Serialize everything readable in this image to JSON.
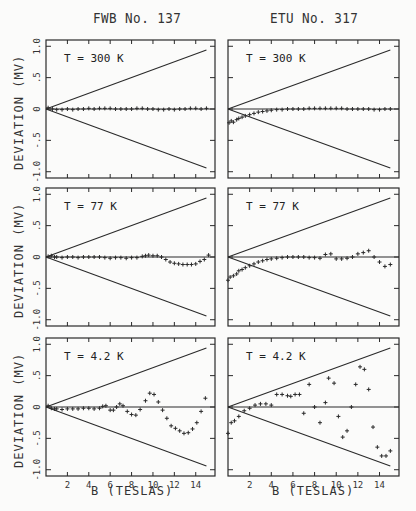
{
  "columns": [
    {
      "title": "FWB No. 137"
    },
    {
      "title": "ETU No. 317"
    }
  ],
  "ylabel": "DEVIATION (MV)",
  "xlabel": "B (TESLAS)",
  "ticks": {
    "y": [
      "1.0",
      ".5",
      "0",
      "-.5",
      "-1.0"
    ],
    "y_values": [
      1.0,
      0.5,
      0,
      -0.5,
      -1.0
    ],
    "x": [
      "2",
      "4",
      "6",
      "8",
      "10",
      "12",
      "14"
    ],
    "x_values": [
      2,
      4,
      6,
      8,
      10,
      12,
      14
    ]
  },
  "panels": [
    {
      "label": "T = 300 K"
    },
    {
      "label": "T = 300 K"
    },
    {
      "label": "T =  77 K"
    },
    {
      "label": "T =  77 K"
    },
    {
      "label": "T = 4.2 K"
    },
    {
      "label": "T = 4.2 K"
    }
  ],
  "chart_data": [
    {
      "type": "scatter",
      "title": "FWB No. 137, T = 300 K",
      "xlabel": "B (TESLAS)",
      "ylabel": "DEVIATION (MV)",
      "xlim": [
        0,
        15.8
      ],
      "ylim": [
        -1.1,
        1.1
      ],
      "envelope": {
        "slope_mv_per_T": 0.0627,
        "x_end": 15
      },
      "x": [
        0.2,
        0.6,
        1,
        1.5,
        2,
        2.5,
        3,
        3.5,
        4,
        4.5,
        5,
        5.5,
        6,
        6.5,
        7,
        7.5,
        8,
        8.5,
        9,
        9.5,
        10,
        10.5,
        11,
        11.5,
        12,
        12.5,
        13,
        13.5,
        14,
        14.5,
        15
      ],
      "y": [
        0.02,
        0.0,
        -0.01,
        -0.01,
        0.0,
        -0.01,
        0.0,
        0.0,
        0.01,
        0.0,
        0.01,
        0.01,
        0.01,
        0.0,
        0.0,
        0.0,
        0.0,
        0.01,
        0.01,
        0.0,
        0.0,
        -0.01,
        -0.01,
        0.0,
        -0.01,
        0.0,
        0.0,
        0.01,
        0.01,
        0.0,
        0.01
      ]
    },
    {
      "type": "scatter",
      "title": "ETU No. 317, T = 300 K",
      "xlabel": "B (TESLAS)",
      "ylabel": "DEVIATION (MV)",
      "xlim": [
        0,
        15.8
      ],
      "ylim": [
        -1.1,
        1.1
      ],
      "envelope": {
        "slope_mv_per_T": 0.0627,
        "x_end": 15
      },
      "x": [
        0.1,
        0.3,
        0.5,
        0.8,
        1,
        1.3,
        1.6,
        2,
        2.4,
        2.8,
        3.2,
        3.6,
        4,
        4.5,
        5,
        5.5,
        6,
        6.5,
        7,
        7.5,
        8,
        8.5,
        9,
        9.5,
        10,
        10.5,
        11,
        11.5,
        12,
        12.5,
        13,
        13.5,
        14,
        14.5,
        15
      ],
      "y": [
        -0.22,
        -0.19,
        -0.21,
        -0.17,
        -0.15,
        -0.13,
        -0.11,
        -0.09,
        -0.07,
        -0.05,
        -0.04,
        -0.03,
        -0.02,
        -0.01,
        -0.01,
        0.0,
        0.0,
        0.0,
        0.0,
        0.01,
        0.01,
        0.01,
        0.01,
        0.01,
        0.01,
        0.01,
        0.0,
        0.0,
        0.0,
        0.0,
        0.0,
        -0.01,
        -0.01,
        0.0,
        0.0
      ]
    },
    {
      "type": "scatter",
      "title": "FWB No. 137, T = 77 K",
      "xlabel": "B (TESLAS)",
      "ylabel": "DEVIATION (MV)",
      "xlim": [
        0,
        15.8
      ],
      "ylim": [
        -1.1,
        1.1
      ],
      "envelope": {
        "slope_mv_per_T": 0.0627,
        "x_end": 15
      },
      "x": [
        0.2,
        0.5,
        0.8,
        1,
        1.5,
        2,
        2.5,
        3,
        3.5,
        4,
        4.5,
        5,
        5.5,
        6,
        6.5,
        7,
        7.5,
        8,
        8.5,
        9,
        9.3,
        9.6,
        10,
        10.4,
        10.8,
        11.2,
        11.6,
        12,
        12.4,
        12.8,
        13.2,
        13.6,
        14,
        14.4,
        14.8,
        15.2
      ],
      "y": [
        0.01,
        0.02,
        0.0,
        0.0,
        -0.01,
        0.0,
        0.0,
        -0.01,
        0.0,
        0.0,
        0.0,
        0.0,
        -0.01,
        -0.02,
        -0.01,
        -0.01,
        -0.02,
        -0.01,
        -0.01,
        0.01,
        0.02,
        0.03,
        0.02,
        0.02,
        0.0,
        -0.04,
        -0.08,
        -0.1,
        -0.11,
        -0.12,
        -0.12,
        -0.12,
        -0.11,
        -0.07,
        -0.04,
        0.03,
        0.09,
        0.15
      ]
    },
    {
      "type": "scatter",
      "title": "ETU No. 317, T = 77 K",
      "xlabel": "B (TESLAS)",
      "ylabel": "DEVIATION (MV)",
      "xlim": [
        0,
        15.8
      ],
      "ylim": [
        -1.1,
        1.1
      ],
      "envelope": {
        "slope_mv_per_T": 0.0627,
        "x_end": 15
      },
      "x": [
        0.0,
        0.2,
        0.5,
        0.8,
        1,
        1.3,
        1.6,
        2,
        2.4,
        2.8,
        3.2,
        3.6,
        4,
        4.5,
        5,
        5.5,
        6,
        6.5,
        7,
        7.5,
        8,
        8.5,
        9,
        9.5,
        10,
        10.5,
        11,
        11.5,
        12,
        12.5,
        13,
        13.5,
        14,
        14.5,
        15
      ],
      "y": [
        -0.37,
        -0.32,
        -0.3,
        -0.27,
        -0.22,
        -0.2,
        -0.17,
        -0.14,
        -0.11,
        -0.08,
        -0.06,
        -0.04,
        -0.03,
        -0.02,
        -0.01,
        0.0,
        0.0,
        0.0,
        0.0,
        -0.01,
        -0.01,
        -0.02,
        0.04,
        0.05,
        -0.03,
        -0.03,
        -0.02,
        0.0,
        0.05,
        0.07,
        0.1,
        0.0,
        -0.08,
        -0.15,
        -0.12
      ]
    },
    {
      "type": "scatter",
      "title": "FWB No. 137, T = 4.2 K",
      "xlabel": "B (TESLAS)",
      "ylabel": "DEVIATION (MV)",
      "xlim": [
        0,
        15.8
      ],
      "ylim": [
        -1.1,
        1.1
      ],
      "envelope": {
        "slope_mv_per_T": 0.0627,
        "x_end": 15
      },
      "x": [
        0.2,
        0.5,
        0.8,
        1,
        1.5,
        2,
        2.5,
        3,
        3.5,
        4,
        4.5,
        5,
        5.3,
        5.6,
        6,
        6.3,
        6.6,
        6.9,
        7.2,
        7.6,
        8,
        8.4,
        8.8,
        9.3,
        9.7,
        10.1,
        10.5,
        10.9,
        11.3,
        11.7,
        12.1,
        12.5,
        12.9,
        13.3,
        13.7,
        14.1,
        14.5,
        14.9
      ],
      "y": [
        0.02,
        -0.02,
        -0.03,
        -0.03,
        -0.04,
        -0.03,
        -0.03,
        -0.03,
        -0.02,
        -0.02,
        -0.03,
        -0.02,
        0.01,
        0.02,
        -0.05,
        -0.05,
        0.0,
        0.05,
        0.02,
        -0.07,
        -0.12,
        -0.13,
        -0.04,
        0.1,
        0.22,
        0.2,
        0.08,
        -0.05,
        -0.18,
        -0.3,
        -0.34,
        -0.38,
        -0.42,
        -0.41,
        -0.35,
        -0.25,
        -0.07,
        0.14
      ]
    },
    {
      "type": "scatter",
      "title": "ETU No. 317, T = 4.2 K",
      "xlabel": "B (TESLAS)",
      "ylabel": "DEVIATION (MV)",
      "xlim": [
        0,
        15.8
      ],
      "ylim": [
        -1.1,
        1.1
      ],
      "envelope": {
        "slope_mv_per_T": 0.0627,
        "x_end": 15
      },
      "x": [
        0.0,
        0.3,
        0.6,
        1,
        1.5,
        2,
        2.5,
        3,
        3.5,
        4,
        4.5,
        5,
        5.5,
        5.8,
        6.2,
        6.6,
        7,
        7.5,
        8,
        8.5,
        9,
        9.3,
        9.8,
        10.2,
        10.6,
        11,
        11.4,
        11.8,
        12.2,
        12.6,
        13,
        13.4,
        13.8,
        14.2,
        14.6,
        15
      ],
      "y": [
        -0.42,
        -0.25,
        -0.22,
        -0.15,
        -0.06,
        -0.02,
        0.03,
        0.05,
        0.05,
        0.03,
        0.2,
        0.2,
        0.18,
        0.17,
        0.2,
        0.2,
        -0.1,
        0.36,
        0.0,
        -0.25,
        0.07,
        0.46,
        0.38,
        -0.15,
        -0.48,
        -0.38,
        0.0,
        0.36,
        0.64,
        0.6,
        0.28,
        -0.32,
        -0.64,
        -0.78,
        -0.78,
        -0.7
      ]
    }
  ]
}
